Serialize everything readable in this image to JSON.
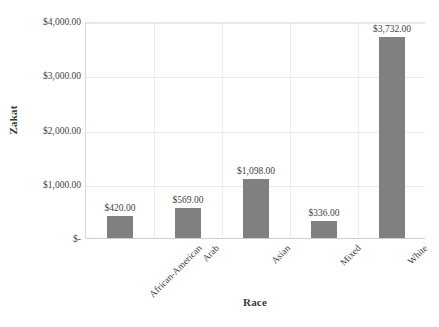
{
  "chart_data": {
    "type": "bar",
    "title": "",
    "subtitle": "",
    "xlabel": "Race",
    "ylabel": "Zakat",
    "categories": [
      "African-American",
      "Arab",
      "Asian",
      "Mixed",
      "White"
    ],
    "values": [
      420,
      569,
      1098,
      336,
      3732
    ],
    "data_labels": [
      "$420.00",
      "$569.00",
      "$1,098.00",
      "$336.00",
      "$3,732.00"
    ],
    "ylim": [
      0,
      4000
    ],
    "yticks": [
      0,
      1000,
      2000,
      3000,
      4000
    ],
    "ytick_labels": [
      "$-",
      "$1,000.00",
      "$2,000.00",
      "$3,000.00",
      "$4,000.00"
    ],
    "grid": "both",
    "legend": "none",
    "bar_color": "#808080",
    "gridline_color": "#e8e8e8",
    "background_color": "#ffffff"
  },
  "axes": {
    "y_title": "Zakat",
    "x_title": "Race"
  }
}
